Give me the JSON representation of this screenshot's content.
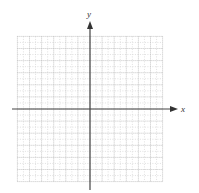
{
  "diagram": {
    "type": "coordinate-grid",
    "axes": {
      "x_label": "x",
      "y_label": "y"
    },
    "grid": {
      "cells_left_of_origin": 6,
      "cells_right_of_origin": 6,
      "cells_above_origin": 6,
      "cells_below_origin": 6,
      "minor_subdivisions": 2,
      "major_line_color": "#b5b5b5",
      "minor_line_color": "#d8d8d8",
      "axis_color": "#444444"
    }
  },
  "chart_data": {
    "type": "scatter",
    "title": "",
    "xlabel": "x",
    "ylabel": "y",
    "xlim": [
      -6,
      6
    ],
    "ylim": [
      -6,
      6
    ],
    "grid": true,
    "series": []
  }
}
